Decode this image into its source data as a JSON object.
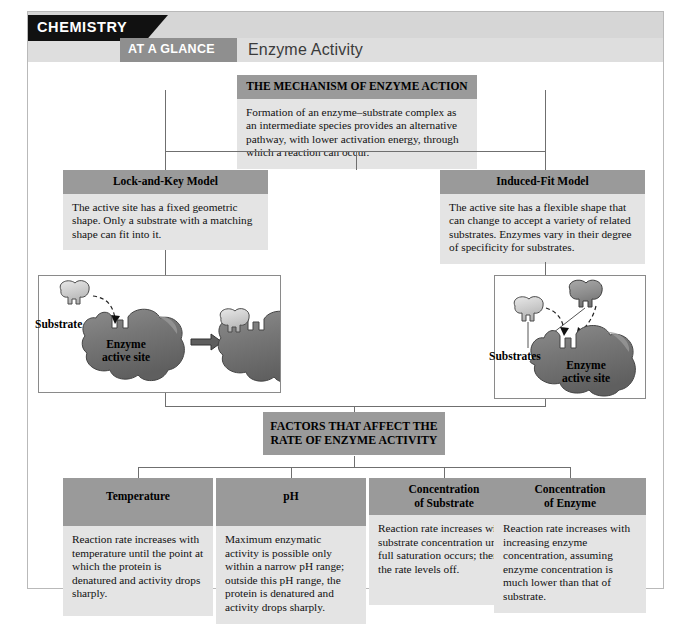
{
  "header": {
    "series_label": "CHEMISTRY",
    "tab_label": "AT A GLANCE",
    "title": "Enzyme Activity"
  },
  "mechanism": {
    "heading": "THE MECHANISM OF ENZYME ACTION",
    "text": "Formation of an enzyme–substrate complex as an intermediate species provides an alternative pathway, with lower activation energy, through which a reaction can occur."
  },
  "models": [
    {
      "heading": "Lock-and-Key Model",
      "text": "The active site has a fixed geometric shape. Only a substrate with a matching shape can fit into it."
    },
    {
      "heading": "Induced-Fit Model",
      "text": "The active site has a flexible shape that can change to accept a variety of related substrates. Enzymes vary in their degree of specificity for substrates."
    }
  ],
  "illustrations": {
    "left": {
      "substrate_label": "Substrate",
      "enzyme_label_line1": "Enzyme",
      "enzyme_label_line2": "active site"
    },
    "right": {
      "substrates_label": "Substrates",
      "enzyme_label_line1": "Enzyme",
      "enzyme_label_line2": "active site"
    }
  },
  "factors_heading": {
    "line1": "FACTORS THAT AFFECT THE",
    "line2": "RATE OF ENZYME ACTIVITY"
  },
  "factors": [
    {
      "heading": "Temperature",
      "heading_line2": "",
      "text": "Reaction rate increases with temperature until the point at which the protein is denatured and activity drops sharply."
    },
    {
      "heading": "pH",
      "heading_line2": "",
      "text": "Maximum enzymatic activity is possible only within a narrow pH range; outside this pH range, the protein is denatured and activity drops sharply."
    },
    {
      "heading": "Concentration",
      "heading_line2": "of Substrate",
      "text": "Reaction rate increases with substrate concentration until full saturation occurs; then the rate levels off."
    },
    {
      "heading": "Concentration",
      "heading_line2": "of Enzyme",
      "text": "Reaction rate increases with increasing enzyme concentration, assuming enzyme concentration is much lower than that of substrate."
    }
  ],
  "colors": {
    "bar_gray": "#9a9a9a",
    "body_gray": "#e4e4e4",
    "header_band": "#d6d6d6",
    "tab_gray": "#8f8f8f",
    "black": "#111111",
    "enzyme_dark": "#6f6f6f",
    "substrate_light": "#cfcfcf",
    "line": "#6f6f6f"
  }
}
